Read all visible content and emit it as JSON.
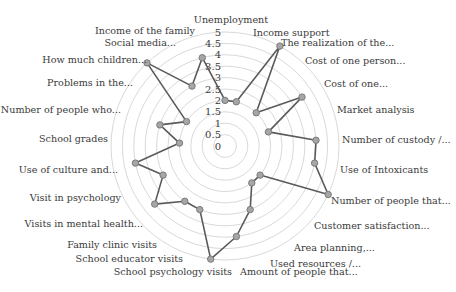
{
  "chart_data": {
    "type": "radar",
    "title": "",
    "axis": {
      "min": 0,
      "max": 5,
      "step": 0.5,
      "ticks": [
        "0",
        "0.5",
        "1",
        "1.5",
        "2",
        "2.5",
        "3",
        "3.5",
        "4",
        "4.5",
        "5"
      ]
    },
    "grid": true,
    "legend": null,
    "categories": [
      "Unemployment",
      "Income support",
      "The realization of the...",
      "Cost of one person...",
      "Cost of one...",
      "Market analysis",
      "Number of custody /...",
      "Use of Intoxicants",
      "Number of people that...",
      "Customer satisfaction...",
      "Area planning,...",
      "Used resources /...",
      "Amount of people that...",
      "School psychology visits",
      "School educator visits",
      "Family clinic visits",
      "Visits in mental health...",
      "Visit in psychology",
      "Use of culture and...",
      "School grades",
      "Number of people who...",
      "Problems in the...",
      "How much children...",
      "Social media...",
      "Income of the family"
    ],
    "series": [
      {
        "name": "Series 1",
        "values": [
          2,
          2,
          5,
          2,
          4,
          2,
          4,
          4,
          5,
          2,
          2,
          3,
          4,
          5,
          3,
          3,
          4,
          3,
          4,
          2,
          3,
          2,
          5,
          3,
          4
        ]
      }
    ]
  },
  "style": {
    "line_color": "#5a5a5a",
    "marker_fill": "#a6a6a6",
    "marker_stroke": "#7a7a7a",
    "grid_color": "#d9d9d9",
    "text_color": "#3a3a3a"
  },
  "layout": {
    "center": [
      225,
      146
    ],
    "radius": 114,
    "label_positions": [
      {
        "x": 231,
        "y": 23,
        "anchor": "middle"
      },
      {
        "x": 253,
        "y": 36,
        "anchor": "start"
      },
      {
        "x": 281,
        "y": 46,
        "anchor": "start"
      },
      {
        "x": 305,
        "y": 64,
        "anchor": "start"
      },
      {
        "x": 324,
        "y": 87,
        "anchor": "start"
      },
      {
        "x": 337,
        "y": 113,
        "anchor": "start"
      },
      {
        "x": 342,
        "y": 143,
        "anchor": "start"
      },
      {
        "x": 340,
        "y": 173,
        "anchor": "start"
      },
      {
        "x": 331,
        "y": 204,
        "anchor": "start"
      },
      {
        "x": 314,
        "y": 229,
        "anchor": "start"
      },
      {
        "x": 294,
        "y": 251,
        "anchor": "start"
      },
      {
        "x": 270,
        "y": 267,
        "anchor": "start"
      },
      {
        "x": 240,
        "y": 275,
        "anchor": "start"
      },
      {
        "x": 232,
        "y": 275,
        "anchor": "end"
      },
      {
        "x": 183,
        "y": 262,
        "anchor": "end"
      },
      {
        "x": 157,
        "y": 248,
        "anchor": "end"
      },
      {
        "x": 143,
        "y": 227,
        "anchor": "end"
      },
      {
        "x": 121,
        "y": 201,
        "anchor": "end"
      },
      {
        "x": 118,
        "y": 173,
        "anchor": "end"
      },
      {
        "x": 108,
        "y": 142,
        "anchor": "end"
      },
      {
        "x": 121,
        "y": 113,
        "anchor": "end"
      },
      {
        "x": 133,
        "y": 86,
        "anchor": "end"
      },
      {
        "x": 147,
        "y": 63,
        "anchor": "end"
      },
      {
        "x": 176,
        "y": 46,
        "anchor": "end"
      },
      {
        "x": 195,
        "y": 34,
        "anchor": "end"
      }
    ]
  }
}
